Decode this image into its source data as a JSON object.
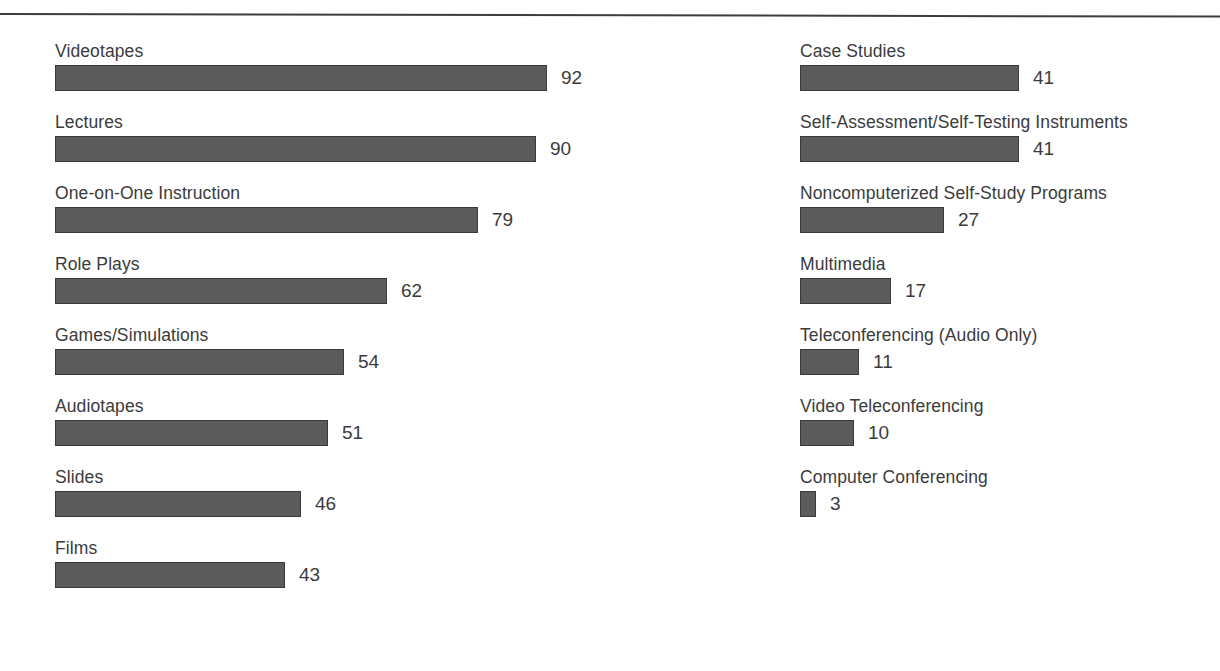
{
  "figure": {
    "background_color": "#ffffff",
    "bar_color": "#5b5b5b",
    "bar_border_color": "#3a3a3a",
    "text_color": "#3b3b3b",
    "rule_color": "#3d3d3d"
  },
  "chart_data": {
    "type": "bar",
    "orientation": "horizontal",
    "title": "",
    "subtitle": "",
    "xlabel": "",
    "ylabel": "",
    "xlim": [
      0,
      92
    ],
    "grid": false,
    "legend": false,
    "value_labels": true,
    "layout": "two-column, labels above bars, values to the right of bars",
    "categories": [
      "Videotapes",
      "Lectures",
      "One-on-One Instruction",
      "Role Plays",
      "Games/Simulations",
      "Audiotapes",
      "Slides",
      "Films",
      "Case Studies",
      "Self-Assessment/Self-Testing Instruments",
      "Noncomputerized Self-Study Programs",
      "Multimedia",
      "Teleconferencing (Audio Only)",
      "Video Teleconferencing",
      "Computer Conferencing"
    ],
    "values": [
      92,
      90,
      79,
      62,
      54,
      51,
      46,
      43,
      41,
      41,
      27,
      17,
      11,
      10,
      3
    ],
    "columns": [
      {
        "name": "left-column",
        "items": [
          {
            "label": "Videotapes",
            "value": 92,
            "value_text": "92"
          },
          {
            "label": "Lectures",
            "value": 90,
            "value_text": "90"
          },
          {
            "label": "One-on-One Instruction",
            "value": 79,
            "value_text": "79"
          },
          {
            "label": "Role Plays",
            "value": 62,
            "value_text": "62"
          },
          {
            "label": "Games/Simulations",
            "value": 54,
            "value_text": "54"
          },
          {
            "label": "Audiotapes",
            "value": 51,
            "value_text": "51"
          },
          {
            "label": "Slides",
            "value": 46,
            "value_text": "46"
          },
          {
            "label": "Films",
            "value": 43,
            "value_text": "43"
          }
        ]
      },
      {
        "name": "right-column",
        "items": [
          {
            "label": "Case Studies",
            "value": 41,
            "value_text": "41"
          },
          {
            "label": "Self-Assessment/Self-Testing Instruments",
            "value": 41,
            "value_text": "41"
          },
          {
            "label": "Noncomputerized Self-Study Programs",
            "value": 27,
            "value_text": "27"
          },
          {
            "label": "Multimedia",
            "value": 17,
            "value_text": "17"
          },
          {
            "label": "Teleconferencing (Audio Only)",
            "value": 11,
            "value_text": "11"
          },
          {
            "label": "Video Teleconferencing",
            "value": 10,
            "value_text": "10"
          },
          {
            "label": "Computer Conferencing",
            "value": 3,
            "value_text": "3"
          }
        ]
      }
    ]
  },
  "render": {
    "row_pitch_px": 71,
    "first_row_top_px": 41,
    "px_per_unit": 5.35,
    "value_gap_px": 14
  }
}
